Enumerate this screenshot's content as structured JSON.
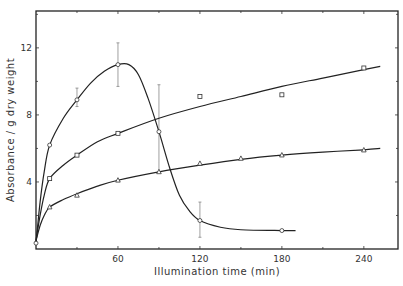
{
  "chart_data": {
    "type": "line",
    "title": "",
    "xlabel": "Illumination time (min)",
    "ylabel": "Absorbance / g dry weight",
    "xlim": [
      0,
      265
    ],
    "ylim": [
      0,
      14.2
    ],
    "x_ticks": [
      60,
      120,
      180,
      240
    ],
    "x_tick_labels": [
      "60",
      "120",
      "180",
      "240"
    ],
    "x_minor_ticks": [
      30,
      90,
      150,
      210
    ],
    "y_ticks": [
      4,
      8,
      12
    ],
    "y_tick_labels": [
      "4",
      "8",
      "12"
    ],
    "y_minor_ticks": [
      2,
      6,
      10,
      14
    ],
    "grid": false,
    "legend": null,
    "series": [
      {
        "name": "circles",
        "marker": "circle",
        "x": [
          0,
          10,
          30,
          60,
          90,
          120,
          180
        ],
        "values": [
          0.35,
          6.2,
          8.9,
          11.0,
          7.0,
          1.7,
          1.1
        ],
        "error_bars": [
          {
            "x": 30,
            "low": 8.5,
            "high": 9.6
          },
          {
            "x": 60,
            "low": 9.7,
            "high": 12.3
          },
          {
            "x": 90,
            "low": 4.6,
            "high": 9.8
          },
          {
            "x": 120,
            "low": 0.7,
            "high": 2.8
          }
        ],
        "curve": [
          [
            0,
            0.35
          ],
          [
            3,
            2.8
          ],
          [
            6,
            4.6
          ],
          [
            10,
            6.2
          ],
          [
            20,
            7.8
          ],
          [
            30,
            8.9
          ],
          [
            40,
            9.9
          ],
          [
            50,
            10.6
          ],
          [
            60,
            11.0
          ],
          [
            68,
            11.0
          ],
          [
            75,
            10.4
          ],
          [
            82,
            9.0
          ],
          [
            90,
            7.0
          ],
          [
            98,
            4.8
          ],
          [
            105,
            3.2
          ],
          [
            112,
            2.3
          ],
          [
            120,
            1.7
          ],
          [
            135,
            1.3
          ],
          [
            150,
            1.15
          ],
          [
            180,
            1.1
          ],
          [
            190,
            1.1
          ]
        ]
      },
      {
        "name": "squares",
        "marker": "square",
        "x": [
          10,
          30,
          60,
          120,
          180,
          240
        ],
        "values": [
          4.2,
          5.6,
          6.9,
          9.1,
          9.2,
          10.8
        ],
        "curve": [
          [
            0,
            0.5
          ],
          [
            3,
            2.0
          ],
          [
            6,
            3.2
          ],
          [
            10,
            4.2
          ],
          [
            20,
            5.0
          ],
          [
            30,
            5.6
          ],
          [
            45,
            6.4
          ],
          [
            60,
            6.9
          ],
          [
            90,
            7.8
          ],
          [
            120,
            8.5
          ],
          [
            150,
            9.1
          ],
          [
            180,
            9.7
          ],
          [
            210,
            10.2
          ],
          [
            240,
            10.7
          ],
          [
            252,
            10.9
          ]
        ]
      },
      {
        "name": "triangles",
        "marker": "triangle",
        "x": [
          10,
          30,
          60,
          90,
          120,
          150,
          180,
          240
        ],
        "values": [
          2.5,
          3.2,
          4.1,
          4.6,
          5.1,
          5.4,
          5.6,
          5.9
        ],
        "curve": [
          [
            0,
            0.5
          ],
          [
            3,
            1.4
          ],
          [
            6,
            2.0
          ],
          [
            10,
            2.5
          ],
          [
            20,
            2.95
          ],
          [
            30,
            3.3
          ],
          [
            45,
            3.75
          ],
          [
            60,
            4.1
          ],
          [
            90,
            4.6
          ],
          [
            120,
            5.0
          ],
          [
            150,
            5.35
          ],
          [
            180,
            5.6
          ],
          [
            210,
            5.78
          ],
          [
            240,
            5.92
          ],
          [
            252,
            6.0
          ]
        ]
      }
    ]
  }
}
